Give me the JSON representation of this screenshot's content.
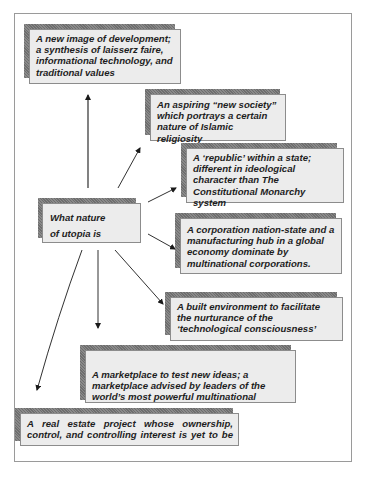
{
  "diagram": {
    "central_node": {
      "text": "What nature of utopia is"
    },
    "nodes": [
      {
        "id": "development",
        "text": "A new image of development; a synthesis of laisserz faire, informational technology, and traditional values"
      },
      {
        "id": "new-society",
        "text": "An aspiring “new society” which portrays a certain nature of Islamic religiosity"
      },
      {
        "id": "republic",
        "text": "A ‘republic’ within a state; different in ideological character than The Constitutional Monarchy system"
      },
      {
        "id": "corporation",
        "text": "A corporation nation-state and a manufacturing hub in a global economy dominate by multinational corporations."
      },
      {
        "id": "built-environment",
        "text": "A built environment to facilitate the nurturance of the ‘technological consciousness’"
      },
      {
        "id": "marketplace",
        "text": "A marketplace to test new ideas; a marketplace advised by leaders of the world’s most powerful multinational"
      },
      {
        "id": "real-estate",
        "text": "A real estate project whose ownership, control, and controlling interest is yet to be"
      }
    ],
    "edges": [
      {
        "from": "central",
        "to": "development"
      },
      {
        "from": "central",
        "to": "new-society"
      },
      {
        "from": "central",
        "to": "republic"
      },
      {
        "from": "central",
        "to": "corporation"
      },
      {
        "from": "central",
        "to": "built-environment"
      },
      {
        "from": "central",
        "to": "marketplace"
      },
      {
        "from": "central",
        "to": "real-estate"
      }
    ]
  }
}
